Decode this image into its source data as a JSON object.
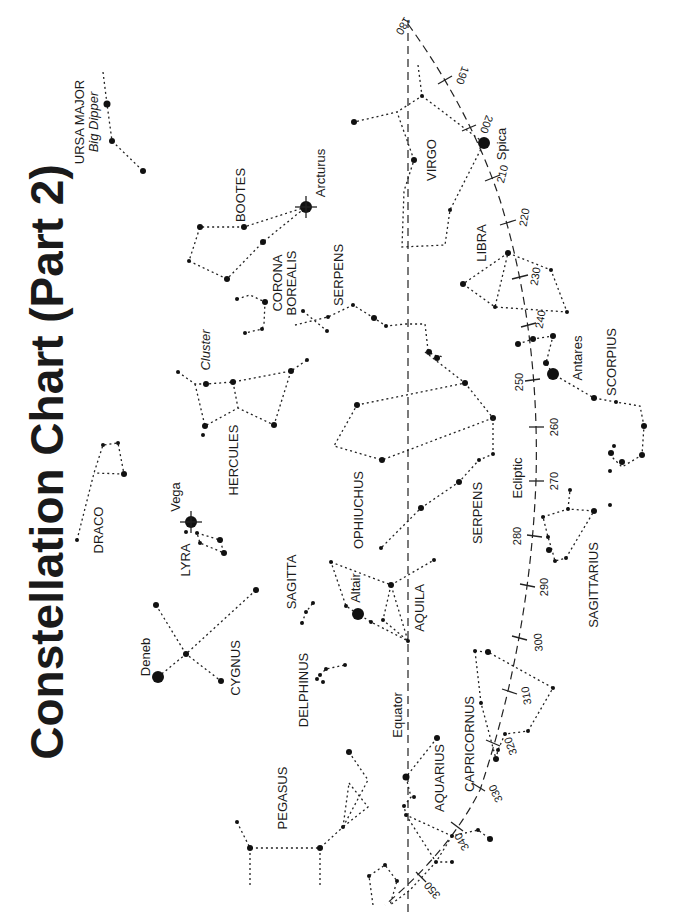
{
  "title": "Constellation Chart (Part 2)",
  "reference_lines": {
    "equator_label": "Equator",
    "ecliptic_label": "Ecliptic",
    "ecliptic_ticks": [
      {
        "label": "180",
        "x": 408,
        "y": 28
      },
      {
        "label": "190",
        "x": 445,
        "y": 80
      },
      {
        "label": "200",
        "x": 470,
        "y": 128
      },
      {
        "label": "210",
        "x": 492,
        "y": 178
      },
      {
        "label": "220",
        "x": 508,
        "y": 222
      },
      {
        "label": "230",
        "x": 520,
        "y": 277
      },
      {
        "label": "240",
        "x": 528,
        "y": 325
      },
      {
        "label": "250",
        "x": 532,
        "y": 380
      },
      {
        "label": "260",
        "x": 536,
        "y": 427
      },
      {
        "label": "270",
        "x": 536,
        "y": 481
      },
      {
        "label": "280",
        "x": 534,
        "y": 536
      },
      {
        "label": "290",
        "x": 528,
        "y": 585
      },
      {
        "label": "300",
        "x": 520,
        "y": 638
      },
      {
        "label": "310",
        "x": 510,
        "y": 692
      },
      {
        "label": "320",
        "x": 494,
        "y": 743
      },
      {
        "label": "330",
        "x": 478,
        "y": 787
      },
      {
        "label": "340",
        "x": 457,
        "y": 827
      },
      {
        "label": "350",
        "x": 421,
        "y": 877
      }
    ]
  },
  "constellations": [
    {
      "name": "URSA MAJOR",
      "subtitle": "Big Dipper"
    },
    {
      "name": "BOOTES"
    },
    {
      "name": "CORONA BOREALIS",
      "lines": [
        "CORONA",
        "BOREALIS"
      ]
    },
    {
      "name": "SERPENS"
    },
    {
      "name": "VIRGO"
    },
    {
      "name": "LIBRA"
    },
    {
      "name": "SCORPIUS"
    },
    {
      "name": "HERCULES",
      "subtitle": "Cluster"
    },
    {
      "name": "OPHIUCHUS"
    },
    {
      "name": "SERPENS"
    },
    {
      "name": "DRACO"
    },
    {
      "name": "LYRA"
    },
    {
      "name": "SAGITTA"
    },
    {
      "name": "AQUILA"
    },
    {
      "name": "SAGITTARIUS"
    },
    {
      "name": "CYGNUS"
    },
    {
      "name": "DELPHINUS"
    },
    {
      "name": "CAPRICORNUS"
    },
    {
      "name": "AQUARIUS"
    },
    {
      "name": "PEGASUS"
    }
  ],
  "named_stars": [
    {
      "name": "Arcturus",
      "constellation": "BOOTES"
    },
    {
      "name": "Spica",
      "constellation": "VIRGO"
    },
    {
      "name": "Antares",
      "constellation": "SCORPIUS"
    },
    {
      "name": "Vega",
      "constellation": "LYRA"
    },
    {
      "name": "Altair",
      "constellation": "AQUILA"
    },
    {
      "name": "Deneb",
      "constellation": "CYGNUS"
    }
  ],
  "colors": {
    "ink": "#1a1a1a",
    "background": "#ffffff"
  }
}
